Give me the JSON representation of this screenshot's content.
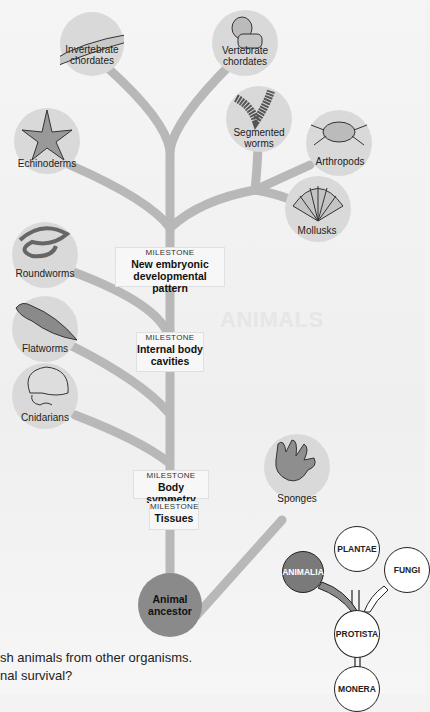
{
  "diagram": {
    "watermark": "ANIMALS",
    "colors": {
      "background": "#f3f3f3",
      "branch": "#b5b5b5",
      "node_fill": "#d9d9d9",
      "ancestor_fill": "#8a8a8a",
      "kingdom_active": "#7a7a7a"
    },
    "groups": [
      {
        "id": "invertebrate-chordates",
        "label": "Invertebrate chordates",
        "line1": "Invertebrate",
        "line2": "chordates"
      },
      {
        "id": "vertebrate-chordates",
        "label": "Vertebrate chordates",
        "line1": "Vertebrate",
        "line2": "chordates"
      },
      {
        "id": "segmented-worms",
        "label": "Segmented worms",
        "line1": "Segmented",
        "line2": "worms"
      },
      {
        "id": "echinoderms",
        "label": "Echinoderms",
        "line1": "Echinoderms",
        "line2": ""
      },
      {
        "id": "arthropods",
        "label": "Arthropods",
        "line1": "Arthropods",
        "line2": ""
      },
      {
        "id": "mollusks",
        "label": "Mollusks",
        "line1": "Mollusks",
        "line2": ""
      },
      {
        "id": "roundworms",
        "label": "Roundworms",
        "line1": "Roundworms",
        "line2": ""
      },
      {
        "id": "flatworms",
        "label": "Flatworms",
        "line1": "Flatworms",
        "line2": ""
      },
      {
        "id": "cnidarians",
        "label": "Cnidarians",
        "line1": "Cnidarians",
        "line2": ""
      },
      {
        "id": "sponges",
        "label": "Sponges",
        "line1": "Sponges",
        "line2": ""
      }
    ],
    "milestones": [
      {
        "kicker": "MILESTONE",
        "title_line1": "New embryonic",
        "title_line2": "developmental pattern"
      },
      {
        "kicker": "MILESTONE",
        "title_line1": "Internal body",
        "title_line2": "cavities"
      },
      {
        "kicker": "MILESTONE",
        "title_line1": "Body symmetry",
        "title_line2": ""
      },
      {
        "kicker": "MILESTONE",
        "title_line1": "Tissues",
        "title_line2": ""
      }
    ],
    "ancestor": {
      "line1": "Animal",
      "line2": "ancestor"
    }
  },
  "kingdoms": {
    "items": [
      {
        "label": "ANIMALIA",
        "active": true
      },
      {
        "label": "PLANTAE",
        "active": false
      },
      {
        "label": "FUNGI",
        "active": false
      },
      {
        "label": "PROTISTA",
        "active": false
      },
      {
        "label": "MONERA",
        "active": false
      }
    ]
  },
  "text": {
    "question_line1": "sh animals from other organisms.",
    "question_line2": "nal survival?"
  }
}
